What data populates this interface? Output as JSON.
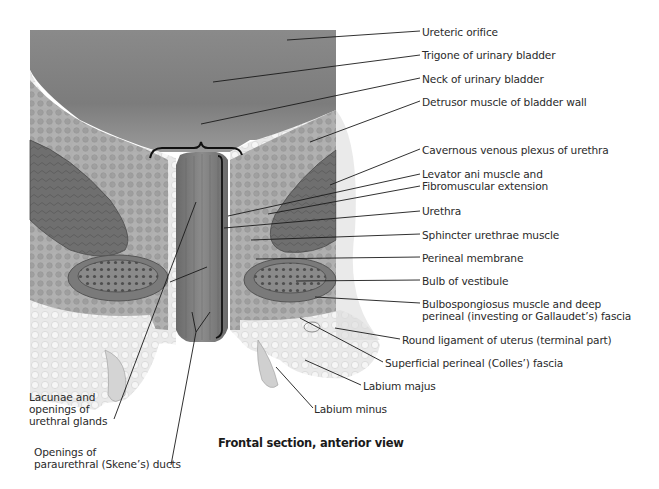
{
  "figure": {
    "caption": "Frontal section, anterior view",
    "colors": {
      "background": "#ffffff",
      "bladder_lumen": "#7a7a7a",
      "muscle_dark": "#6b6b6b",
      "fat_light": "#e6e6e6",
      "leader_line": "#1a1a1a",
      "text": "#2a2a2a"
    },
    "labels_right": [
      {
        "id": "ureteric-orifice",
        "text": "Ureteric orifice"
      },
      {
        "id": "trigone",
        "text": "Trigone of urinary bladder"
      },
      {
        "id": "neck-bladder",
        "text": "Neck of urinary bladder"
      },
      {
        "id": "detrusor",
        "text": "Detrusor muscle of bladder wall"
      },
      {
        "id": "cavernous-plexus",
        "text": "Cavernous venous plexus of urethra"
      },
      {
        "id": "levator-ani",
        "text": "Levator ani muscle and"
      },
      {
        "id": "fibromuscular",
        "text": "Fibromuscular extension"
      },
      {
        "id": "urethra",
        "text": "Urethra"
      },
      {
        "id": "sphincter",
        "text": "Sphincter urethrae muscle"
      },
      {
        "id": "perineal-membrane",
        "text": "Perineal membrane"
      },
      {
        "id": "bulb-vestibule",
        "text": "Bulb of vestibule"
      },
      {
        "id": "bulbospongiosus",
        "text": "Bulbospongiosus muscle and deep\nperineal (investing or Gallaudet’s) fascia"
      },
      {
        "id": "round-ligament",
        "text": "Round ligament of uterus (terminal part)"
      },
      {
        "id": "colles-fascia",
        "text": "Superficial perineal (Colles’) fascia"
      },
      {
        "id": "labium-majus",
        "text": "Labium majus"
      },
      {
        "id": "labium-minus",
        "text": "Labium minus"
      }
    ],
    "labels_left": [
      {
        "id": "lacunae",
        "text": "Lacunae and\nopenings of\nurethral glands"
      },
      {
        "id": "skenes",
        "text": "Openings of\nparaurethral (Skene’s) ducts"
      }
    ]
  }
}
